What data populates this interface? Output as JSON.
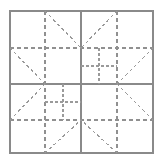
{
  "figure": {
    "canvas": {
      "width": 162,
      "height": 164
    },
    "background_color": "#ffffff"
  },
  "style": {
    "frame_color": "#8a8a8a",
    "frame_width": 1.6,
    "solid_color": "#8a8a8a",
    "solid_width": 1.3,
    "dashed_color": "#909090",
    "dashed_width": 1.3,
    "dash_pattern": "4,3",
    "diagonal_color": "#9a9a9a",
    "diagonal_width": 1.1,
    "diagonal_dash_pattern": "3,3",
    "inner_color": "#9a9a9a",
    "inner_width": 1.1,
    "inner_dash_pattern": "3,2"
  },
  "geometry": {
    "frame": {
      "left": 10,
      "top": 11,
      "right": 153,
      "bottom": 153
    },
    "grid": {
      "x_quarter": 45,
      "x_center": 81,
      "x_three_quarter": 117,
      "y_quarter": 48,
      "y_center": 84,
      "y_three_quarter": 120
    },
    "inner_square_top_right": {
      "left": 81,
      "top": 48,
      "right": 117,
      "bottom": 84,
      "mid_x": 99,
      "mid_y": 66
    },
    "inner_square_bottom_left": {
      "left": 45,
      "top": 84,
      "right": 81,
      "bottom": 120,
      "mid_x": 63,
      "mid_y": 102
    }
  },
  "elements": {
    "outer_frame": "outer-frame-square",
    "center_vertical": "center-vertical-solid-line",
    "center_horizontal": "center-horizontal-solid-line",
    "dashed_vertical_left": "dashed-vertical-left",
    "dashed_vertical_right": "dashed-vertical-right",
    "dashed_horizontal_top": "dashed-horizontal-top",
    "dashed_horizontal_bottom": "dashed-horizontal-bottom",
    "diagonals": "diagonal-seam-lines",
    "inner_squares": "nested-sub-square-grids"
  },
  "paths": {
    "outer_frame_rect": {
      "x": 10,
      "y": 11,
      "width": 143,
      "height": 142
    },
    "solid_lines": [
      {
        "name": "center-vertical",
        "x1": 81,
        "y1": 11,
        "x2": 81,
        "y2": 153
      },
      {
        "name": "center-horizontal",
        "x1": 10,
        "y1": 84,
        "x2": 153,
        "y2": 84
      }
    ],
    "dashed_lines": [
      {
        "name": "dashed-vertical-left",
        "x1": 45,
        "y1": 11,
        "x2": 45,
        "y2": 153
      },
      {
        "name": "dashed-vertical-right",
        "x1": 117,
        "y1": 11,
        "x2": 117,
        "y2": 153
      },
      {
        "name": "dashed-horizontal-top",
        "x1": 10,
        "y1": 48,
        "x2": 153,
        "y2": 48
      },
      {
        "name": "dashed-horizontal-bottom",
        "x1": 10,
        "y1": 120,
        "x2": 153,
        "y2": 120
      }
    ],
    "diagonal_lines": [
      {
        "name": "diag-tl-upper",
        "x1": 45,
        "y1": 11,
        "x2": 81,
        "y2": 48
      },
      {
        "name": "diag-tl-lower",
        "x1": 10,
        "y1": 48,
        "x2": 45,
        "y2": 84
      },
      {
        "name": "diag-tr-upper",
        "x1": 117,
        "y1": 11,
        "x2": 81,
        "y2": 48
      },
      {
        "name": "diag-tr-lower",
        "x1": 153,
        "y1": 48,
        "x2": 117,
        "y2": 84
      },
      {
        "name": "diag-bl-upper",
        "x1": 10,
        "y1": 120,
        "x2": 45,
        "y2": 84
      },
      {
        "name": "diag-bl-lower",
        "x1": 45,
        "y1": 153,
        "x2": 81,
        "y2": 120
      },
      {
        "name": "diag-br-upper",
        "x1": 153,
        "y1": 120,
        "x2": 117,
        "y2": 84
      },
      {
        "name": "diag-br-lower",
        "x1": 117,
        "y1": 153,
        "x2": 81,
        "y2": 120
      }
    ],
    "inner_square_lines": [
      {
        "name": "tr-inner-vertical",
        "x1": 99,
        "y1": 48,
        "x2": 99,
        "y2": 84
      },
      {
        "name": "tr-inner-horizontal",
        "x1": 81,
        "y1": 66,
        "x2": 117,
        "y2": 66
      },
      {
        "name": "bl-inner-vertical",
        "x1": 63,
        "y1": 84,
        "x2": 63,
        "y2": 120
      },
      {
        "name": "bl-inner-horizontal",
        "x1": 45,
        "y1": 102,
        "x2": 81,
        "y2": 102
      }
    ]
  }
}
